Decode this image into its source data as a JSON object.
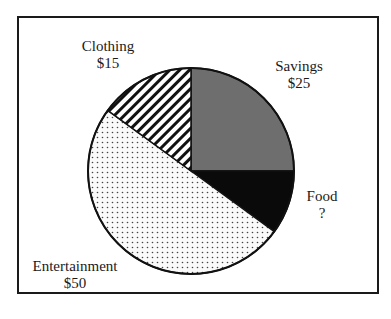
{
  "chart_data": {
    "type": "pie",
    "title": "",
    "categories": [
      "Savings",
      "Food",
      "Entertainment",
      "Clothing"
    ],
    "values": [
      25,
      null,
      50,
      15
    ],
    "value_labels": [
      "$25",
      "?",
      "$50",
      "$15"
    ],
    "implied_values": [
      25,
      10,
      50,
      15
    ],
    "fills": [
      "solid-gray",
      "solid-black",
      "dotted",
      "diagonal-stripes"
    ],
    "colors": [
      "#6e6e6e",
      "#0a0a0a",
      "#f2f2f2",
      "#ffffff"
    ]
  },
  "labels": {
    "clothing": {
      "name": "Clothing",
      "value": "$15"
    },
    "savings": {
      "name": "Savings",
      "value": "$25"
    },
    "food": {
      "name": "Food",
      "value": "?"
    },
    "entertainment": {
      "name": "Entertainment",
      "value": "$50"
    }
  }
}
